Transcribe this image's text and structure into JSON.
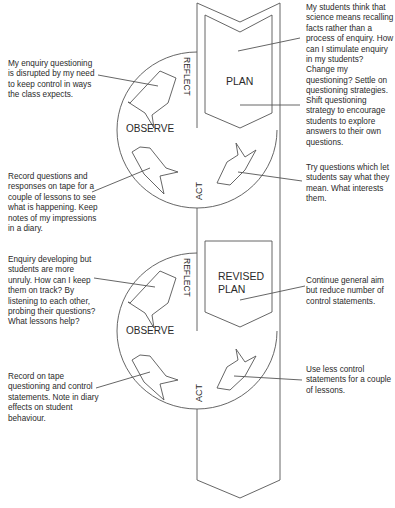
{
  "diagram": {
    "type": "action-research spiral",
    "cycles": [
      {
        "id": "cycle-1",
        "stages": {
          "plan": "PLAN",
          "act": "ACT",
          "observe": "OBSERVE",
          "reflect": "REFLECT"
        },
        "notes": {
          "plan_problem": "My students think that science means recalling facts rather than a process of enquiry. How can I stimulate enquiry in my students? Change my questioning? Settle on questioning strategies.",
          "plan_strategy": "Shift questioning strategy to encourage students to explore answers to their own questions.",
          "act": "Try questions which let students say what they mean. What interests them.",
          "observe": "Record questions and responses on tape for a couple of lessons to see what is happening. Keep notes of my impressions in a diary.",
          "reflect": "My enquiry questioning is disrupted by my need to keep control in ways the class expects."
        }
      },
      {
        "id": "cycle-2",
        "stages": {
          "plan_line1": "REVISED",
          "plan_line2": "PLAN",
          "act": "ACT",
          "observe": "OBSERVE",
          "reflect": "REFLECT"
        },
        "notes": {
          "plan": "Continue general aim but reduce number of control statements.",
          "act": "Use less control statements for a couple of lessons.",
          "observe": "Record on tape questioning and control statements. Note in diary effects on student behaviour.",
          "reflect": "Enquiry developing but students are more unruly. How can I keep them on track? By listening to each other, probing their questions? What lessons help?"
        }
      }
    ],
    "colors": {
      "line": "#555555",
      "text": "#2a2a2a",
      "background": "#ffffff"
    }
  }
}
